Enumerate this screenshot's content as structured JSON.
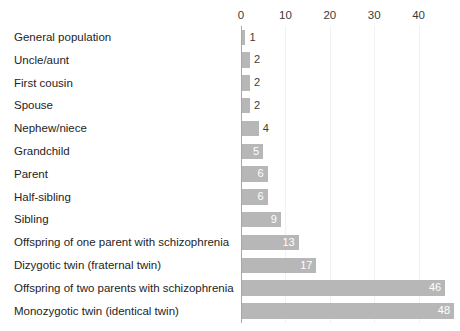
{
  "chart_data": {
    "type": "bar",
    "orientation": "horizontal",
    "title": "",
    "xlabel": "",
    "ylabel": "",
    "xlim": [
      0,
      49
    ],
    "xticks": [
      0,
      10,
      20,
      30,
      40
    ],
    "grid": true,
    "legend": "none",
    "categories": [
      "General population",
      "Uncle/aunt",
      "First cousin",
      "Spouse",
      "Nephew/niece",
      "Grandchild",
      "Parent",
      "Half-sibling",
      "Sibling",
      "Offspring of one parent with schizophrenia",
      "Dizygotic twin (fraternal twin)",
      "Offspring of two parents with schizophrenia",
      "Monozygotic twin (identical twin)"
    ],
    "values": [
      1,
      2,
      2,
      2,
      4,
      5,
      6,
      6,
      9,
      13,
      17,
      46,
      48
    ],
    "value_labels": [
      "1",
      "2",
      "2",
      "2",
      "4",
      "5",
      "6",
      "6",
      "9",
      "13",
      "17",
      "46",
      "48"
    ],
    "bar_color": "#b7b7b7",
    "grid_color": "#f1f1f1",
    "axis_color": "#a8a8a8",
    "label_color": "#242424",
    "inside_label_color": "#ffffff",
    "outside_label_color": "#3c3c3c"
  }
}
